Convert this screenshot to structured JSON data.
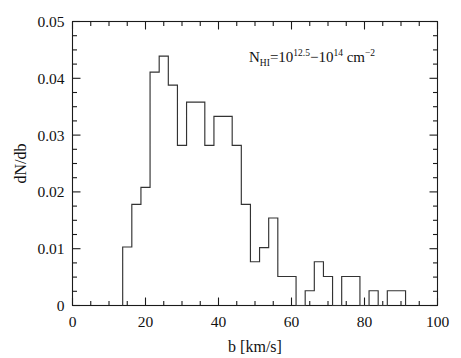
{
  "chart_data": {
    "type": "bar",
    "title": "",
    "subtitle": "",
    "xlabel": "b [km/s]",
    "ylabel": "dN/db",
    "xlim": [
      0,
      100
    ],
    "ylim": [
      0,
      0.05
    ],
    "grid": false,
    "legend_position": "none",
    "bin_width": 2.5,
    "annotation": {
      "text": "N_HI = 10^12.5 - 10^14 cm^-2",
      "n_symbol": "N",
      "n_subscript": "HI",
      "equals": "=",
      "base1": "10",
      "exp1": "12.5",
      "dash": "−",
      "base2": "10",
      "exp2": "14",
      "units": "cm",
      "units_exp": "−2"
    },
    "xticks": [
      0,
      20,
      40,
      60,
      80,
      100
    ],
    "xticklabels": [
      "0",
      "20",
      "40",
      "60",
      "80",
      "100"
    ],
    "yticks": [
      0,
      0.01,
      0.02,
      0.03,
      0.04,
      0.05
    ],
    "yticklabels": [
      "0",
      "0.01",
      "0.02",
      "0.03",
      "0.04",
      "0.05"
    ],
    "x_minor_step": 5,
    "y_minor_step": 0.0025,
    "bin_edges": [
      13.75,
      16.25,
      18.75,
      21.25,
      23.75,
      26.25,
      28.75,
      31.25,
      33.75,
      36.25,
      38.75,
      41.25,
      43.75,
      46.25,
      48.75,
      51.25,
      53.75,
      56.25,
      58.75,
      61.25,
      63.75,
      66.25,
      68.75,
      71.25,
      73.75,
      76.25,
      78.75,
      81.25,
      83.75,
      86.25,
      88.75,
      91.25
    ],
    "values": [
      0.0103,
      0.0178,
      0.0208,
      0.0411,
      0.0439,
      0.0388,
      0.0282,
      0.0358,
      0.0358,
      0.0282,
      0.0333,
      0.0333,
      0.0282,
      0.0178,
      0.0077,
      0.0102,
      0.0154,
      0.0051,
      0.0051,
      0.0,
      0.0026,
      0.0077,
      0.0051,
      0.0,
      0.0051,
      0.0051,
      0.0,
      0.0026,
      0.0,
      0.0026,
      0.0026,
      0.0
    ],
    "line_color": "#333333",
    "axis_color": "#1a1a1a",
    "background_color": "#ffffff"
  }
}
